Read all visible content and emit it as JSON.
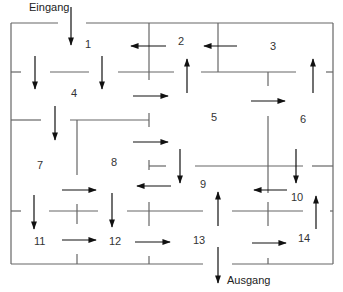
{
  "diagram": {
    "type": "maze floor plan",
    "entrance_label": "Eingang",
    "exit_label": "Ausgang",
    "rooms": [
      {
        "id": "1",
        "x": 88,
        "y": 44
      },
      {
        "id": "2",
        "x": 180,
        "y": 41
      },
      {
        "id": "3",
        "x": 272,
        "y": 46
      },
      {
        "id": "4",
        "x": 73,
        "y": 92
      },
      {
        "id": "5",
        "x": 213,
        "y": 117
      },
      {
        "id": "6",
        "x": 302,
        "y": 119
      },
      {
        "id": "7",
        "x": 38,
        "y": 164
      },
      {
        "id": "8",
        "x": 112,
        "y": 162
      },
      {
        "id": "9",
        "x": 201,
        "y": 184
      },
      {
        "id": "10",
        "x": 294,
        "y": 196
      },
      {
        "id": "11",
        "x": 35,
        "y": 240
      },
      {
        "id": "12",
        "x": 110,
        "y": 240
      },
      {
        "id": "13",
        "x": 195,
        "y": 240
      },
      {
        "id": "14",
        "x": 300,
        "y": 237
      }
    ],
    "colors": {
      "line": "#555555",
      "arrow": "#111111",
      "text": "#333333"
    }
  }
}
